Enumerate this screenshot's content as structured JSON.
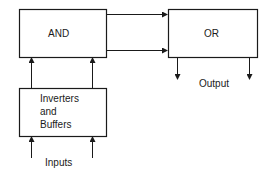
{
  "diagram": {
    "blocks": {
      "and": {
        "label": "AND"
      },
      "or": {
        "label": "OR"
      },
      "inverters": {
        "line1": "Inverters",
        "line2": "and",
        "line3": "Buffers"
      }
    },
    "labels": {
      "output": "Output",
      "inputs": "Inputs"
    },
    "colors": {
      "stroke": "#1a1a1a",
      "background": "#ffffff"
    }
  }
}
